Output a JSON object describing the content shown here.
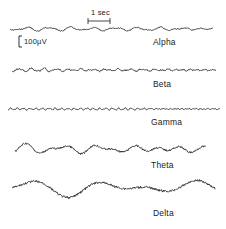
{
  "figure": {
    "time_scale_label": "1 sec",
    "amplitude_scale_label": "100µV",
    "traces": [
      {
        "label": "Alpha",
        "baseline_y": 29,
        "amp": 1.6,
        "freq": 10,
        "noise": 0.9,
        "x0": 10,
        "x1": 213
      },
      {
        "label": "Beta",
        "baseline_y": 70,
        "amp": 1.3,
        "freq": 18,
        "noise": 1.0,
        "x0": 12,
        "x1": 216
      },
      {
        "label": "Gamma",
        "baseline_y": 109,
        "amp": 0.9,
        "freq": 35,
        "noise": 0.6,
        "x0": 8,
        "x1": 220
      },
      {
        "label": "Theta",
        "baseline_y": 149,
        "amp": 4.5,
        "freq": 6,
        "noise": 1.5,
        "x0": 15,
        "x1": 206
      },
      {
        "label": "Delta",
        "baseline_y": 188,
        "amp": 7,
        "freq": 2.5,
        "noise": 1.8,
        "x0": 12,
        "x1": 215
      }
    ]
  }
}
